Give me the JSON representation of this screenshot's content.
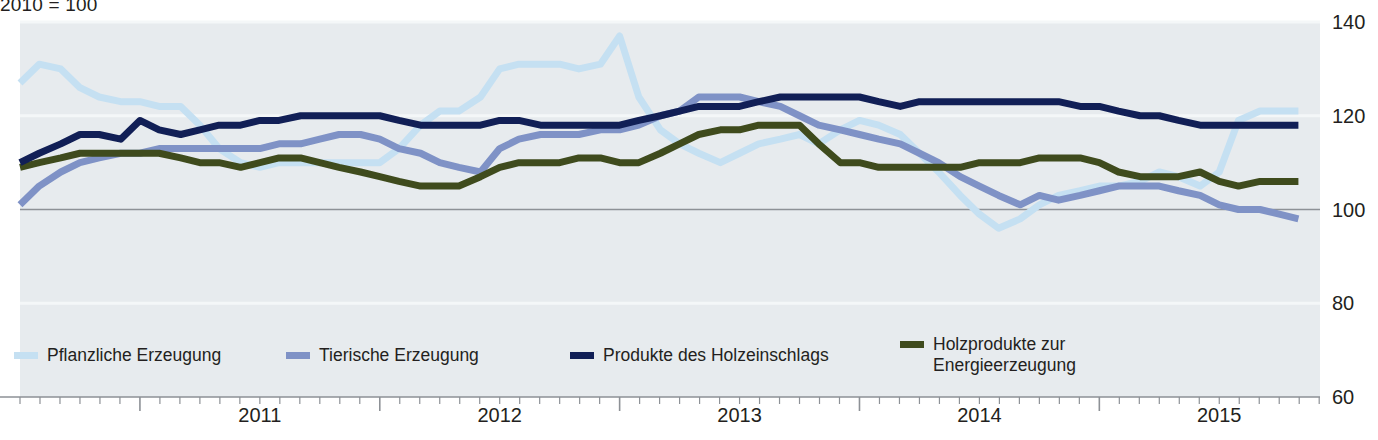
{
  "unit_caption": "2010 = 100",
  "axes": {
    "y_ticks": [
      {
        "label": "140",
        "value": 140
      },
      {
        "label": "120",
        "value": 120
      },
      {
        "label": "100",
        "value": 100
      },
      {
        "label": "80",
        "value": 80
      },
      {
        "label": "60",
        "value": 60
      }
    ],
    "x_ticks": [
      {
        "label": "2011",
        "value": 2011.5
      },
      {
        "label": "2012",
        "value": 2012.5
      },
      {
        "label": "2013",
        "value": 2013.5
      },
      {
        "label": "2014",
        "value": 2014.5
      },
      {
        "label": "2015",
        "value": 2015.5
      }
    ]
  },
  "legend": {
    "items": [
      {
        "label": "Pflanzliche Erzeugung",
        "color": "#c5e0f2"
      },
      {
        "label": "Tierische Erzeugung",
        "color": "#7f92c6"
      },
      {
        "label": "Produkte des Holzeinschlags",
        "color": "#111f56"
      },
      {
        "label": "Holzprodukte zur\nEnergieerzeugung",
        "color": "#3f4b1d"
      }
    ]
  },
  "colors": {
    "panel_background": "#e7ebee",
    "gridline": "#f4f7f8",
    "baseline_100": "#8d9196",
    "axis_line": "#8d9196",
    "text": "#231f20"
  },
  "chart_data": {
    "type": "line",
    "title": "",
    "subtitle": "2010 = 100",
    "xlabel": "",
    "ylabel": "2010 = 100",
    "xlim": [
      2010.5,
      2015.92
    ],
    "ylim": [
      60,
      140
    ],
    "yticks": [
      60,
      80,
      100,
      120,
      140
    ],
    "grid": true,
    "legend_position": "bottom",
    "x_unit": "month",
    "x_start": "2010-07",
    "x": [
      2010.5,
      2010.58,
      2010.67,
      2010.75,
      2010.83,
      2010.92,
      2011.0,
      2011.08,
      2011.17,
      2011.25,
      2011.33,
      2011.42,
      2011.5,
      2011.58,
      2011.67,
      2011.75,
      2011.83,
      2011.92,
      2012.0,
      2012.08,
      2012.17,
      2012.25,
      2012.33,
      2012.42,
      2012.5,
      2012.58,
      2012.67,
      2012.75,
      2012.83,
      2012.92,
      2013.0,
      2013.08,
      2013.17,
      2013.25,
      2013.33,
      2013.42,
      2013.5,
      2013.58,
      2013.67,
      2013.75,
      2013.83,
      2013.92,
      2014.0,
      2014.08,
      2014.17,
      2014.25,
      2014.33,
      2014.42,
      2014.5,
      2014.58,
      2014.67,
      2014.75,
      2014.83,
      2014.92,
      2015.0,
      2015.08,
      2015.17,
      2015.25,
      2015.33,
      2015.42,
      2015.5,
      2015.58,
      2015.67,
      2015.75,
      2015.83
    ],
    "series": [
      {
        "name": "Pflanzliche Erzeugung",
        "color": "#c5e0f2",
        "values": [
          127,
          131,
          130,
          126,
          124,
          123,
          123,
          122,
          122,
          118,
          113,
          110,
          109,
          110,
          110,
          110,
          110,
          110,
          110,
          113,
          118,
          121,
          121,
          124,
          130,
          131,
          131,
          131,
          130,
          131,
          137,
          124,
          117,
          114,
          112,
          110,
          112,
          114,
          115,
          116,
          114,
          117,
          119,
          118,
          116,
          112,
          108,
          103,
          99,
          96,
          98,
          101,
          103,
          104,
          105,
          105,
          106,
          108,
          107,
          105,
          108,
          119,
          121,
          121,
          121
        ]
      },
      {
        "name": "Tierische Erzeugung",
        "color": "#7f92c6",
        "values": [
          101,
          105,
          108,
          110,
          111,
          112,
          112,
          113,
          113,
          113,
          113,
          113,
          113,
          114,
          114,
          115,
          116,
          116,
          115,
          113,
          112,
          110,
          109,
          108,
          113,
          115,
          116,
          116,
          116,
          117,
          117,
          118,
          120,
          121,
          124,
          124,
          124,
          123,
          122,
          120,
          118,
          117,
          116,
          115,
          114,
          112,
          110,
          107,
          105,
          103,
          101,
          103,
          102,
          103,
          104,
          105,
          105,
          105,
          104,
          103,
          101,
          100,
          100,
          99,
          98
        ]
      },
      {
        "name": "Produkte des Holzeinschlags",
        "color": "#111f56",
        "values": [
          110,
          112,
          114,
          116,
          116,
          115,
          119,
          117,
          116,
          117,
          118,
          118,
          119,
          119,
          120,
          120,
          120,
          120,
          120,
          119,
          118,
          118,
          118,
          118,
          119,
          119,
          118,
          118,
          118,
          118,
          118,
          119,
          120,
          121,
          122,
          122,
          122,
          123,
          124,
          124,
          124,
          124,
          124,
          123,
          122,
          123,
          123,
          123,
          123,
          123,
          123,
          123,
          123,
          122,
          122,
          121,
          120,
          120,
          119,
          118,
          118,
          118,
          118,
          118,
          118
        ]
      },
      {
        "name": "Holzprodukte zur Energieerzeugung",
        "color": "#3f4b1d",
        "values": [
          109,
          110,
          111,
          112,
          112,
          112,
          112,
          112,
          111,
          110,
          110,
          109,
          110,
          111,
          111,
          110,
          109,
          108,
          107,
          106,
          105,
          105,
          105,
          107,
          109,
          110,
          110,
          110,
          111,
          111,
          110,
          110,
          112,
          114,
          116,
          117,
          117,
          118,
          118,
          118,
          114,
          110,
          110,
          109,
          109,
          109,
          109,
          109,
          110,
          110,
          110,
          111,
          111,
          111,
          110,
          108,
          107,
          107,
          107,
          108,
          106,
          105,
          106,
          106,
          106
        ]
      }
    ]
  }
}
